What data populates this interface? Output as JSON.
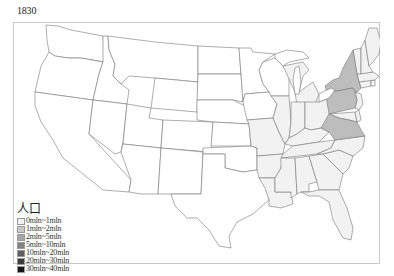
{
  "title": {
    "year": "1830"
  },
  "map": {
    "border_color": "#555555",
    "state_fill_default": "#ffffff",
    "state_fill_0_1": "#f2f2f2",
    "state_fill_1_2": "#bdbdbd",
    "highlighted_states": [
      "New York",
      "Pennsylvania",
      "Virginia"
    ],
    "states_0_1mln": [
      "Maine",
      "New Hampshire",
      "Vermont",
      "Massachusetts",
      "Rhode Island",
      "Connecticut",
      "New Jersey",
      "Delaware",
      "Maryland",
      "North Carolina",
      "South Carolina",
      "Georgia",
      "Alabama",
      "Mississippi",
      "Louisiana",
      "Tennessee",
      "Kentucky",
      "Ohio",
      "Indiana",
      "Illinois",
      "Missouri",
      "Michigan",
      "Arkansas",
      "Florida"
    ]
  },
  "legend": {
    "title": "人口",
    "items": [
      {
        "label": "0mln~1mln",
        "color": "#f2f2f2"
      },
      {
        "label": "1mln~2mln",
        "color": "#c8c8c8"
      },
      {
        "label": "2mln~5mln",
        "color": "#a6a6a6"
      },
      {
        "label": "5mln~10mln",
        "color": "#838383"
      },
      {
        "label": "10mln~20mln",
        "color": "#5f5f5f"
      },
      {
        "label": "20mln~30mln",
        "color": "#3c3c3c"
      },
      {
        "label": "30mln~40mln",
        "color": "#161616"
      }
    ]
  }
}
